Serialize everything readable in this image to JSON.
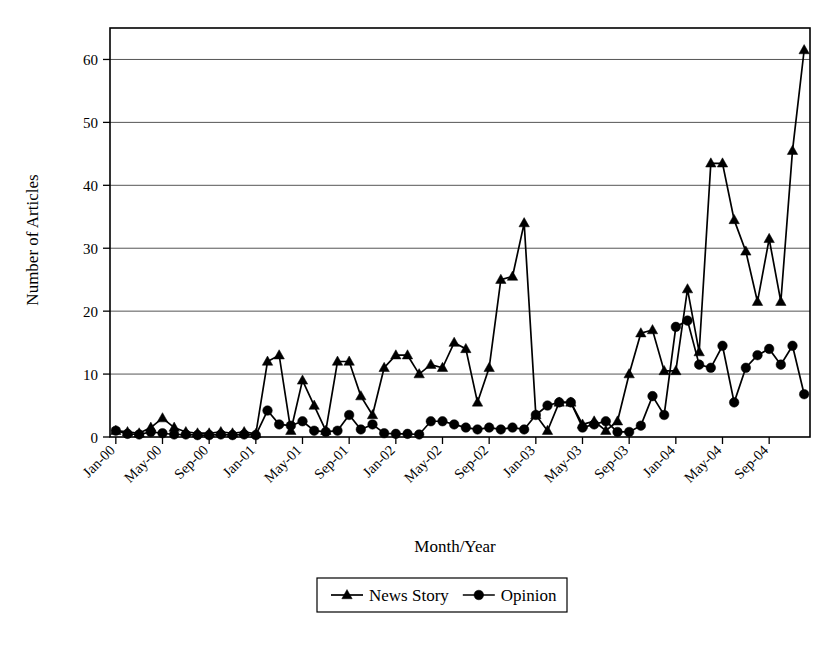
{
  "chart_data": {
    "type": "line",
    "title": "",
    "xlabel": "Month/Year",
    "ylabel": "Number of Articles",
    "ylim": [
      0,
      65
    ],
    "yticks": [
      0,
      10,
      20,
      30,
      40,
      50,
      60
    ],
    "ytick_labels": [
      "0",
      "10",
      "20",
      "30",
      "40",
      "50",
      "60"
    ],
    "grid": true,
    "legend_position": "bottom-center",
    "x_tick_labels": [
      "Jan-00",
      "May-00",
      "Sep-00",
      "Jan-01",
      "May-01",
      "Sep-01",
      "Jan-02",
      "May-02",
      "Sep-02",
      "Jan-03",
      "May-03",
      "Sep-03",
      "Jan-04",
      "May-04",
      "Sep-04"
    ],
    "x_tick_interval_months": 4,
    "x": [
      "Jan-00",
      "Feb-00",
      "Mar-00",
      "Apr-00",
      "May-00",
      "Jun-00",
      "Jul-00",
      "Aug-00",
      "Sep-00",
      "Oct-00",
      "Nov-00",
      "Dec-00",
      "Jan-01",
      "Feb-01",
      "Mar-01",
      "Apr-01",
      "May-01",
      "Jun-01",
      "Jul-01",
      "Aug-01",
      "Sep-01",
      "Oct-01",
      "Nov-01",
      "Dec-01",
      "Jan-02",
      "Feb-02",
      "Mar-02",
      "Apr-02",
      "May-02",
      "Jun-02",
      "Jul-02",
      "Aug-02",
      "Sep-02",
      "Oct-02",
      "Nov-02",
      "Dec-02",
      "Jan-03",
      "Feb-03",
      "Mar-03",
      "Apr-03",
      "May-03",
      "Jun-03",
      "Jul-03",
      "Aug-03",
      "Sep-03",
      "Oct-03",
      "Nov-03",
      "Dec-03",
      "Jan-04",
      "Feb-04",
      "Mar-04",
      "Apr-04",
      "May-04",
      "Jun-04",
      "Jul-04",
      "Aug-04",
      "Sep-04",
      "Oct-04",
      "Nov-04",
      "Dec-04"
    ],
    "series": [
      {
        "name": "News Story",
        "marker": "triangle",
        "color": "#000000",
        "values": [
          1.0,
          0.8,
          0.6,
          1.5,
          3.0,
          1.5,
          0.8,
          0.6,
          0.6,
          0.8,
          0.6,
          0.8,
          0.5,
          12.0,
          13.0,
          1.0,
          9.0,
          5.0,
          1.0,
          12.0,
          12.0,
          6.5,
          3.5,
          11.0,
          13.0,
          13.0,
          10.0,
          11.5,
          11.0,
          15.0,
          14.0,
          5.5,
          11.0,
          25.0,
          25.5,
          34.0,
          3.5,
          1.0,
          5.5,
          5.5,
          2.0,
          2.5,
          1.0,
          2.5,
          10.0,
          16.5,
          17.0,
          10.5,
          10.5,
          23.5,
          13.5,
          43.5,
          43.5,
          34.5,
          29.5,
          21.5,
          31.5,
          21.5,
          45.5,
          61.5
        ]
      },
      {
        "name": "Opinion",
        "marker": "circle",
        "color": "#000000",
        "values": [
          1.0,
          0.5,
          0.4,
          0.8,
          0.6,
          0.4,
          0.4,
          0.3,
          0.3,
          0.4,
          0.3,
          0.4,
          0.3,
          4.2,
          2.0,
          1.8,
          2.5,
          1.0,
          0.8,
          1.0,
          3.5,
          1.2,
          2.0,
          0.6,
          0.5,
          0.5,
          0.4,
          2.5,
          2.5,
          2.0,
          1.5,
          1.2,
          1.5,
          1.2,
          1.5,
          1.2,
          3.5,
          5.0,
          5.5,
          5.5,
          1.5,
          2.0,
          2.5,
          0.8,
          0.8,
          1.8,
          6.5,
          3.5,
          17.5,
          18.5,
          11.5,
          11.0,
          14.5,
          5.5,
          11.0,
          13.0,
          14.0,
          11.5,
          14.5,
          6.8
        ]
      }
    ]
  },
  "legend": {
    "entries": [
      {
        "label": "News Story",
        "marker": "triangle"
      },
      {
        "label": "Opinion",
        "marker": "circle"
      }
    ]
  }
}
